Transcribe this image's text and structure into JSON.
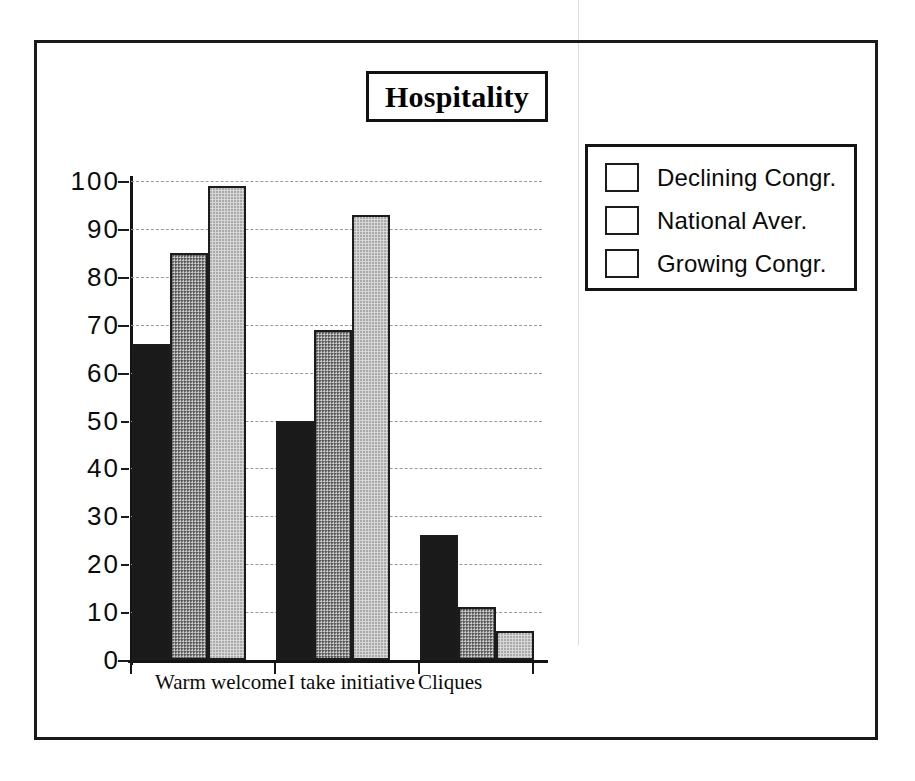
{
  "scan": {
    "top_clipped_text": "",
    "seam_visible": true
  },
  "chart_data": {
    "type": "bar",
    "title": "Hospitality",
    "xlabel": "",
    "ylabel": "",
    "ylim": [
      0,
      100
    ],
    "ytick_step": 10,
    "ytick_labels": [
      "100",
      "90",
      "80",
      "70",
      "60",
      "50",
      "40",
      "30",
      "20",
      "10",
      "0"
    ],
    "grid": true,
    "legend_position": "right",
    "categories": [
      "Warm  welcome",
      "I take initiative",
      "Cliques"
    ],
    "series": [
      {
        "name": "Declining Congr.",
        "color": "#1a1a1a",
        "values": [
          66,
          50,
          26
        ]
      },
      {
        "name": "National  Aver.",
        "color": "#8e8e8e",
        "values": [
          85,
          69,
          11
        ]
      },
      {
        "name": "Growing Congr.",
        "color": "#d6d6d6",
        "values": [
          99,
          93,
          6
        ]
      }
    ]
  },
  "legend": {
    "entries": [
      {
        "label": "Declining Congr."
      },
      {
        "label": "National  Aver."
      },
      {
        "label": "Growing Congr."
      }
    ]
  }
}
